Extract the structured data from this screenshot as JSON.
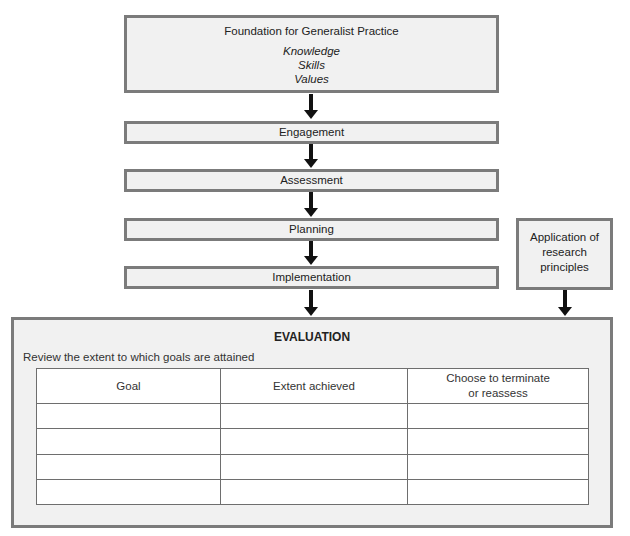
{
  "foundation": {
    "title": "Foundation for Generalist Practice",
    "items": [
      "Knowledge",
      "Skills",
      "Values"
    ]
  },
  "steps": [
    "Engagement",
    "Assessment",
    "Planning",
    "Implementation"
  ],
  "side_box": {
    "lines": [
      "Application of",
      "research",
      "principles"
    ]
  },
  "evaluation": {
    "title": "EVALUATION",
    "subtitle": "Review the extent to which goals are attained",
    "table": {
      "headers": [
        "Goal",
        "Extent achieved",
        "Choose to terminate",
        "or reassess"
      ],
      "rows": [
        [
          "",
          "",
          ""
        ],
        [
          "",
          "",
          ""
        ],
        [
          "",
          "",
          ""
        ],
        [
          "",
          "",
          ""
        ]
      ]
    }
  },
  "colors": {
    "box_fill": "#f1f1f1",
    "box_border": "#7b7b7b",
    "arrow": "#111111"
  }
}
